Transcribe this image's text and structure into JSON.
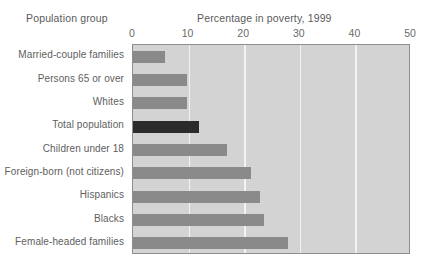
{
  "header": {
    "group_label": "Population group",
    "chart_title": "Percentage in poverty, 1999"
  },
  "chart_data": {
    "type": "bar",
    "orientation": "horizontal",
    "title": "Percentage in poverty, 1999",
    "xlabel": "",
    "ylabel": "Population group",
    "xlim": [
      0,
      50
    ],
    "ylim": null,
    "grid": true,
    "gridlines": [
      10,
      20,
      30,
      40
    ],
    "xticks": [
      0,
      10,
      20,
      30,
      40,
      50
    ],
    "xtick_labels": [
      "0",
      "10",
      "20",
      "30",
      "40",
      "50"
    ],
    "legend": null,
    "categories": [
      "Married-couple families",
      "Persons 65 or over",
      "Whites",
      "Total population",
      "Children under 18",
      "Foreign-born (not citizens)",
      "Hispanics",
      "Blacks",
      "Female-headed families"
    ],
    "values": [
      5.8,
      9.7,
      9.8,
      11.8,
      16.9,
      21.3,
      22.8,
      23.6,
      27.8
    ],
    "highlight_index": 3,
    "colors": {
      "bar": "#8a8a8a",
      "bar_highlight": "#2b2b2b",
      "plot_background": "#d3d3d3",
      "gridline": "#f2f2f2",
      "frame_border": "#8e8e8e",
      "text": "#5a5a5a",
      "page_background": "#ffffff"
    }
  }
}
